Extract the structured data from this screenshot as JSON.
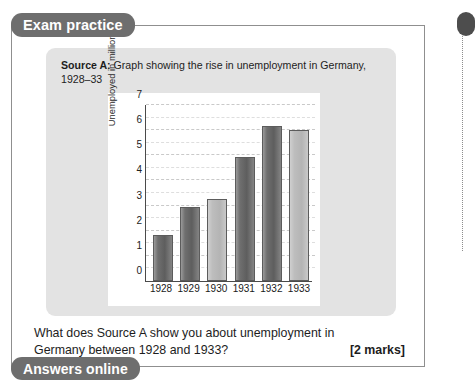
{
  "page": {
    "background": "#ffffff"
  },
  "tabs": {
    "top_label": "Exam practice",
    "bottom_label": "Answers online",
    "tab_color": "#6e6e6e",
    "tab_text_color": "#ffffff"
  },
  "source": {
    "label": "Source A:",
    "caption": " Graph showing the rise in unemployment in Germany, 1928–33",
    "card_color": "#e3e3e3"
  },
  "question": {
    "line1": "What does Source A show you about unemployment in",
    "line2": "Germany between 1928 and 1933?",
    "marks": "[2 marks]"
  },
  "right_edge": {
    "tab_fragment_color": "#4d4d4d",
    "dotted_rule_color": "#8d8d8d"
  },
  "chart_data": {
    "type": "bar",
    "title": "Graph showing the rise in unemployment in Germany, 1928–33",
    "categories": [
      "1928",
      "1929",
      "1930",
      "1931",
      "1932",
      "1933"
    ],
    "values": [
      1.85,
      2.95,
      3.25,
      4.95,
      6.15,
      6.0
    ],
    "xlabel": "",
    "ylabel": "Unemployed in millions",
    "ylim": [
      0,
      7
    ],
    "yticks": [
      0,
      1,
      2,
      3,
      4,
      5,
      6,
      7
    ],
    "ytick_labels": [
      "0",
      "1",
      "2",
      "3",
      "4",
      "5",
      "6",
      "7"
    ],
    "gridlines": {
      "major_step": 1,
      "minor_step": 0.5,
      "style": "dashed",
      "axis": "y"
    },
    "legend": null,
    "bar_styles": [
      "dark",
      "dark",
      "light",
      "dark",
      "dark",
      "light"
    ],
    "plot_background": "#ffffff",
    "bar_dark_color": "#6f6f6f",
    "bar_light_color": "#bdbdbd",
    "axis_color": "#4a4a4a"
  }
}
